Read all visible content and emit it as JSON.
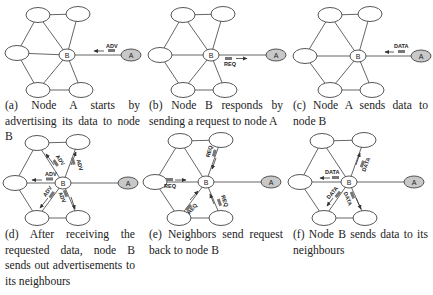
{
  "panels": [
    {
      "id": "a",
      "caption": "(a) Node A starts by advertising its data to node B",
      "nodes": {
        "tl": [
          38,
          15
        ],
        "tr": [
          78,
          14
        ],
        "l": [
          17,
          53
        ],
        "B": [
          67,
          55
        ],
        "bl": [
          38,
          90
        ],
        "br": [
          81,
          90
        ],
        "A": [
          131,
          55
        ]
      },
      "messages": [
        {
          "label": "ADV",
          "from": "A",
          "to": "B"
        }
      ]
    },
    {
      "id": "b",
      "caption": "(b) Node B responds by sending a request to node A",
      "nodes": {
        "tl": [
          183,
          15
        ],
        "tr": [
          223,
          14
        ],
        "l": [
          160,
          55
        ],
        "B": [
          211,
          55
        ],
        "bl": [
          183,
          90
        ],
        "br": [
          225,
          90
        ],
        "A": [
          276,
          55
        ]
      },
      "messages": [
        {
          "label": "REQ",
          "from": "B",
          "to": "A"
        }
      ]
    },
    {
      "id": "c",
      "caption": "(c) Node A sends data to node B",
      "nodes": {
        "tl": [
          330,
          15
        ],
        "tr": [
          370,
          14
        ],
        "l": [
          305,
          56
        ],
        "B": [
          358,
          56
        ],
        "bl": [
          330,
          90
        ],
        "br": [
          372,
          90
        ],
        "A": [
          421,
          56
        ]
      },
      "messages": [
        {
          "label": "DATA",
          "from": "A",
          "to": "B"
        }
      ]
    },
    {
      "id": "d",
      "caption": "(d) After receiving the requested data, node B sends out advertisements to its neighbours",
      "nodes": {
        "tl": [
          37,
          143
        ],
        "tr": [
          78,
          142
        ],
        "l": [
          15,
          183
        ],
        "B": [
          63,
          183
        ],
        "bl": [
          37,
          218
        ],
        "br": [
          78,
          218
        ],
        "A": [
          128,
          183
        ]
      },
      "messages": [
        {
          "label": "ADV",
          "from": "B",
          "to": "tl"
        },
        {
          "label": "ADV",
          "from": "B",
          "to": "tr"
        },
        {
          "label": "ADV",
          "from": "B",
          "to": "l"
        },
        {
          "label": "ADV",
          "from": "B",
          "to": "bl"
        },
        {
          "label": "ADV",
          "from": "B",
          "to": "br"
        }
      ]
    },
    {
      "id": "e",
      "caption": "(e) Neighbors send request back to node B",
      "nodes": {
        "tl": [
          180,
          141
        ],
        "tr": [
          221,
          140
        ],
        "l": [
          155,
          182
        ],
        "B": [
          206,
          182
        ],
        "bl": [
          179,
          218
        ],
        "br": [
          221,
          218
        ],
        "A": [
          271,
          182
        ]
      },
      "messages": [
        {
          "label": "REQ",
          "from": "tr",
          "to": "B"
        },
        {
          "label": "REQ",
          "from": "l",
          "to": "B"
        },
        {
          "label": "REQ",
          "from": "bl",
          "to": "B"
        },
        {
          "label": "REQ",
          "from": "br",
          "to": "B"
        }
      ]
    },
    {
      "id": "f",
      "caption": "(f) Node B sends data to its neighbours",
      "nodes": {
        "tl": [
          322,
          141
        ],
        "tr": [
          364,
          140
        ],
        "l": [
          300,
          182
        ],
        "B": [
          349,
          182
        ],
        "bl": [
          324,
          218
        ],
        "br": [
          365,
          218
        ],
        "A": [
          414,
          182
        ]
      },
      "messages": [
        {
          "label": "DATA",
          "from": "B",
          "to": "tr"
        },
        {
          "label": "DATA",
          "from": "B",
          "to": "l"
        },
        {
          "label": "DATA",
          "from": "B",
          "to": "bl"
        },
        {
          "label": "DATA",
          "from": "B",
          "to": "br"
        }
      ]
    }
  ],
  "labels": {
    "node_b": "B",
    "node_a": "A",
    "adv": "ADV",
    "req": "REQ",
    "data": "DATA"
  },
  "colors": {
    "node_a_fill": "#c8c8c8",
    "edge": "#555555",
    "node_stroke": "#444444"
  }
}
